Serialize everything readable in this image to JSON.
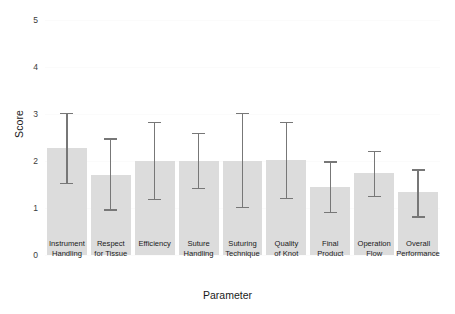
{
  "chart_data": {
    "type": "bar",
    "title": "",
    "xlabel": "Parameter",
    "ylabel": "Score",
    "ylim": [
      0,
      5
    ],
    "yticks": [
      0,
      1,
      2,
      3,
      4,
      5
    ],
    "grid": false,
    "legend": "none",
    "error_bar_type": "range",
    "categories": [
      "Instrument Handling",
      "Respect for Tissue",
      "Efficiency",
      "Suture Handling",
      "Suturing Technique",
      "Quality of Knot",
      "Final Product",
      "Operation Flow",
      "Overall Performance"
    ],
    "category_lines": [
      [
        "Instrument",
        "Handling"
      ],
      [
        "Respect",
        "for Tissue"
      ],
      [
        "Efficiency"
      ],
      [
        "Suture",
        "Handling"
      ],
      [
        "Suturing",
        "Technique"
      ],
      [
        "Quality",
        "of Knot"
      ],
      [
        "Final",
        "Product"
      ],
      [
        "Operation",
        "Flow"
      ],
      [
        "Overall",
        "Performance"
      ]
    ],
    "values": [
      2.28,
      1.7,
      2.0,
      2.0,
      2.0,
      2.02,
      1.44,
      1.75,
      1.33
    ],
    "err_low": [
      1.53,
      0.97,
      1.2,
      1.43,
      1.03,
      1.21,
      0.92,
      1.25,
      0.82
    ],
    "err_high": [
      3.02,
      2.48,
      2.83,
      2.6,
      3.03,
      2.83,
      1.99,
      2.22,
      1.82
    ],
    "colors": {
      "bar_fill": "#dcdcdc",
      "error_bar": "#777777",
      "background": "#ffffff",
      "text": "#1a1a1a",
      "tick_text": "#3b3b3b"
    }
  }
}
